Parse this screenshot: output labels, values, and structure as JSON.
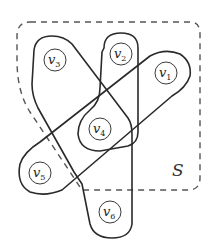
{
  "diagram": {
    "type": "hypergraph",
    "region": {
      "label": "S",
      "style": "dashed"
    },
    "vertices": [
      {
        "id": "v1",
        "base": "v",
        "sub": "1"
      },
      {
        "id": "v2",
        "base": "v",
        "sub": "2"
      },
      {
        "id": "v3",
        "base": "v",
        "sub": "3"
      },
      {
        "id": "v4",
        "base": "v",
        "sub": "4"
      },
      {
        "id": "v5",
        "base": "v",
        "sub": "5"
      },
      {
        "id": "v6",
        "base": "v",
        "sub": "6"
      }
    ],
    "hyperedges": [
      {
        "members": [
          "v2",
          "v4"
        ]
      },
      {
        "members": [
          "v1",
          "v4",
          "v5"
        ]
      },
      {
        "members": [
          "v3",
          "v4",
          "v6"
        ]
      }
    ]
  }
}
